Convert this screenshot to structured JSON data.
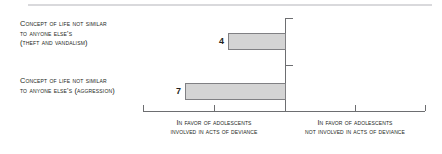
{
  "chart_data": {
    "type": "bar",
    "orientation": "horizontal",
    "title": "",
    "xlabel": "",
    "ylabel": "",
    "categories": [
      "Concept of life not similar to anyone else's (theft and vandalism)",
      "Concept of life not similar to anyone else's (aggression)"
    ],
    "values": [
      4,
      7
    ],
    "value_labels": [
      "4",
      "7"
    ],
    "direction": "bars extend leftward from the zero axis",
    "axis_range_note": "ticks at 4 evenly spaced intervals across the baseline",
    "grid": false,
    "legend": false,
    "axis_group_left": "In favor of adolescents involved in acts of deviance",
    "axis_group_right": "In favor of adolescents not involved in acts of deviance",
    "colors": {
      "bar_fill": "#d4d4d4",
      "bar_border": "#808083",
      "axis": "#6d6e71",
      "text": "#231f20",
      "top_rule": "#d9d9dc"
    }
  },
  "categories": [
    {
      "line1_lead": "C",
      "line1_rest": "oncept of life not similar",
      "line2_lead": "",
      "line2_rest": "to anyone else's",
      "line3_lead": "",
      "line3_rest": "(theft and vandalism)"
    },
    {
      "line1_lead": "C",
      "line1_rest": "oncept of life not similar",
      "line2_lead": "",
      "line2_rest": "to anyone else's (aggression)",
      "line3_lead": "",
      "line3_rest": ""
    }
  ],
  "bar_values": [
    "4",
    "7"
  ],
  "axis_captions": {
    "left": {
      "line1_lead": "I",
      "line1_rest": "n favor of adolescents",
      "line2_rest": "involved in acts of deviance"
    },
    "right": {
      "line1_lead": "I",
      "line1_rest": "n favor of adolescents",
      "line2_rest": "not involved in acts of deviance"
    }
  }
}
